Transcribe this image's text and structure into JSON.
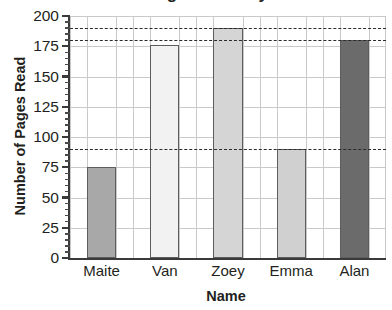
{
  "chart_data": {
    "type": "bar",
    "title": "Number of Pages Read by Student",
    "xlabel": "Name",
    "ylabel": "Number of Pages Read",
    "categories": [
      "Maite",
      "Van",
      "Zoey",
      "Emma",
      "Alan"
    ],
    "values": [
      75,
      176,
      190,
      90,
      180
    ],
    "bar_colors": [
      "#a8a8a8",
      "#f2f2f2",
      "#d5d5d5",
      "#d0d0d0",
      "#6b6b6b"
    ],
    "bar_edge_color": "#5d5d5d",
    "ylim": [
      0,
      200
    ],
    "ytick_labels": [
      "0",
      "25",
      "50",
      "75",
      "100",
      "125",
      "150",
      "175",
      "200"
    ],
    "ytick_values": [
      0,
      25,
      50,
      75,
      100,
      125,
      150,
      175,
      200
    ],
    "yminor_step": 5,
    "grid": true,
    "grid_color": "#c9c9c9",
    "legend": "none",
    "reference_lines": [
      {
        "value": 190,
        "style": "dashed",
        "color": "#2b2b2b"
      },
      {
        "value": 180,
        "style": "dashed",
        "color": "#2b2b2b"
      },
      {
        "value": 90,
        "style": "dashed",
        "color": "#2b2b2b"
      }
    ],
    "axis_color": "#3a3a3a"
  }
}
